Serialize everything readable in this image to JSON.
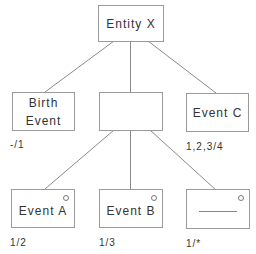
{
  "diagram": {
    "type": "tree",
    "root": {
      "id": "entity-x",
      "label": "Entity X"
    },
    "level1": [
      {
        "id": "birth-event",
        "label_line1": "Birth",
        "label_line2": "Event",
        "cardinality": "-/1"
      },
      {
        "id": "middle-node",
        "label": "",
        "cardinality": ""
      },
      {
        "id": "event-c",
        "label": "Event C",
        "cardinality": "1,2,3/4"
      }
    ],
    "level2": [
      {
        "id": "event-a",
        "label": "Event A",
        "cardinality": "1/2",
        "has_marker": true
      },
      {
        "id": "event-b",
        "label": "Event B",
        "cardinality": "1/3",
        "has_marker": true
      },
      {
        "id": "unnamed-event",
        "label": "",
        "placeholder_line": true,
        "cardinality": "1/*",
        "has_marker": true
      }
    ],
    "edges": [
      [
        "entity-x",
        "birth-event"
      ],
      [
        "entity-x",
        "middle-node"
      ],
      [
        "entity-x",
        "event-c"
      ],
      [
        "middle-node",
        "event-a"
      ],
      [
        "middle-node",
        "event-b"
      ],
      [
        "middle-node",
        "unnamed-event"
      ]
    ],
    "colors": {
      "line": "#8a8a8a",
      "border": "#9a9a9a",
      "text": "#333333"
    }
  }
}
